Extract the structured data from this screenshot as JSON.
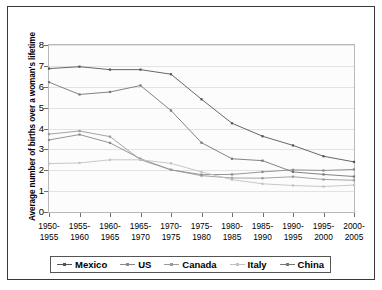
{
  "chart_data": {
    "type": "line",
    "title": "",
    "xlabel": "",
    "ylabel": "Average number of births over a woman's lifetime",
    "ylim": [
      0,
      8
    ],
    "yticks": [
      0,
      1,
      2,
      3,
      4,
      5,
      6,
      7,
      8
    ],
    "grid": true,
    "legend_position": "bottom",
    "categories": [
      "1950-\n1955",
      "1955-\n1960",
      "1960-\n1965",
      "1965-\n1970",
      "1970-\n1975",
      "1975-\n1980",
      "1980-\n1985",
      "1985-\n1990",
      "1990-\n1995",
      "1995-\n2000",
      "2000-\n2005"
    ],
    "category_lines": [
      [
        "1950-",
        "1955"
      ],
      [
        "1955-",
        "1960"
      ],
      [
        "1960-",
        "1965"
      ],
      [
        "1965-",
        "1970"
      ],
      [
        "1970-",
        "1975"
      ],
      [
        "1975-",
        "1980"
      ],
      [
        "1980-",
        "1985"
      ],
      [
        "1985-",
        "1990"
      ],
      [
        "1990-",
        "1995"
      ],
      [
        "1995-",
        "2000"
      ],
      [
        "2000-",
        "2005"
      ]
    ],
    "series": [
      {
        "name": "Mexico",
        "color": "#555555",
        "values": [
          6.87,
          6.96,
          6.82,
          6.82,
          6.6,
          5.4,
          4.25,
          3.63,
          3.19,
          2.67,
          2.4
        ]
      },
      {
        "name": "US",
        "color": "#8a8a8a",
        "values": [
          3.45,
          3.71,
          3.31,
          2.55,
          2.02,
          1.79,
          1.8,
          1.92,
          2.02,
          1.99,
          2.04
        ]
      },
      {
        "name": "Canada",
        "color": "#9a9a9a",
        "values": [
          3.73,
          3.88,
          3.61,
          2.5,
          2.02,
          1.74,
          1.63,
          1.62,
          1.69,
          1.56,
          1.52
        ]
      },
      {
        "name": "Italy",
        "color": "#c2c2c2",
        "values": [
          2.32,
          2.35,
          2.5,
          2.5,
          2.33,
          1.92,
          1.55,
          1.35,
          1.27,
          1.22,
          1.29
        ]
      },
      {
        "name": "China",
        "color": "#767676",
        "values": [
          6.22,
          5.63,
          5.75,
          6.06,
          4.86,
          3.32,
          2.55,
          2.46,
          1.92,
          1.8,
          1.7
        ]
      }
    ]
  },
  "legend": {
    "items": [
      {
        "label": "Mexico"
      },
      {
        "label": "US"
      },
      {
        "label": "Canada"
      },
      {
        "label": "Italy"
      },
      {
        "label": "China"
      }
    ]
  }
}
